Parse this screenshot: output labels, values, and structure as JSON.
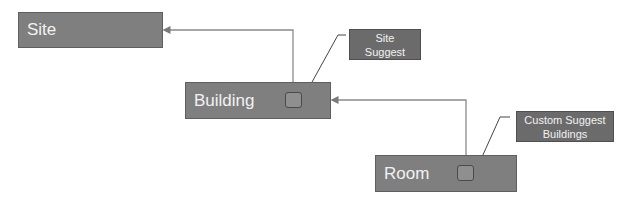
{
  "diagram": {
    "type": "hierarchy-lookup",
    "nodes": [
      {
        "id": "site",
        "label": "Site"
      },
      {
        "id": "building",
        "label": "Building"
      },
      {
        "id": "room",
        "label": "Room"
      }
    ],
    "notes": [
      {
        "id": "site-suggest",
        "line1": "Site",
        "line2": "Suggest",
        "attached_to": "building"
      },
      {
        "id": "custom-suggest-buildings",
        "line1": "Custom Suggest",
        "line2": "Buildings",
        "attached_to": "room"
      }
    ],
    "edges": [
      {
        "from": "building",
        "to": "site"
      },
      {
        "from": "room",
        "to": "building"
      }
    ],
    "colors": {
      "node_fill": "#7f7f7f",
      "note_fill": "#6b6b6b",
      "line": "#7a7a7a",
      "text": "#f2f2f2"
    }
  }
}
